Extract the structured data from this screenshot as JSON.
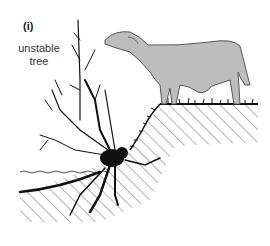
{
  "figure": {
    "panel_label": "(i)",
    "annotation_line1": "unstable",
    "annotation_line2": "tree",
    "colors": {
      "ink": "#111111",
      "cow_fill": "#bdbdbd",
      "cow_outline": "#555555",
      "hatch": "#555555",
      "background": "#ffffff"
    },
    "elements": [
      "unstable-tree",
      "cow",
      "riverbank-slope",
      "water-surface",
      "grass"
    ]
  }
}
